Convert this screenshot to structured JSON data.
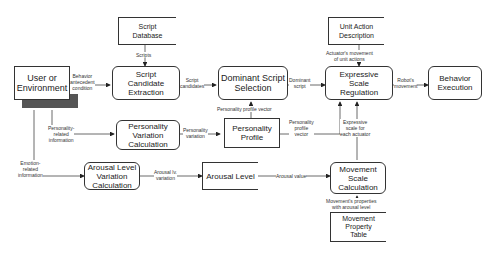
{
  "nodes": {
    "script_database": "Script\nDatabase",
    "user_environment": "User or\nEnvironment",
    "script_candidate_extraction": "Script\nCandidate\nExtraction",
    "dominant_script_selection": "Dominant Script\nSelection",
    "unit_action_description": "Unit Action\nDescription",
    "expressive_scale_regulation": "Expressive\nScale\nRegulation",
    "behavior_execution": "Behavior\nExecution",
    "personality_variation_calculation": "Personality\nVariation\nCalculation",
    "personality_profile": "Personality\nProfile",
    "arousal_level_variation_calculation": "Arousal Level\nVariation\nCalculation",
    "arousal_level": "Arousal Level",
    "movement_scale_calculation": "Movement\nScale\nCalculation",
    "movement_property_table": "Movement\nProperty\nTable"
  },
  "edges": {
    "scripts": "Scripts",
    "behavior_antecedent": "Behavior\nantecedent\ncondition",
    "script_candidates": "Script\ncandidates",
    "dominant_script": "Dominant\nscript",
    "actuator_movement": "Actuator's movement\nof unit actions",
    "robots_movement": "Robot's\nmovement",
    "personality_profile_vector_up": "Personality profile vector",
    "personality_related": "Personality-\nrelated\ninformation",
    "personality_variation": "Personality\nvariation",
    "personality_profile_vector_right": "Personality\nprofile\nvector",
    "expressive_scale": "Expressive\nscale for\neach actuator",
    "emotion_related": "Emotion-\nrelated\ninformation",
    "arousal_lv_variation": "Arousal lv.\nvariation",
    "arousal_value": "Arousal value",
    "movement_properties": "Movement's properties\nwith arousal level"
  }
}
